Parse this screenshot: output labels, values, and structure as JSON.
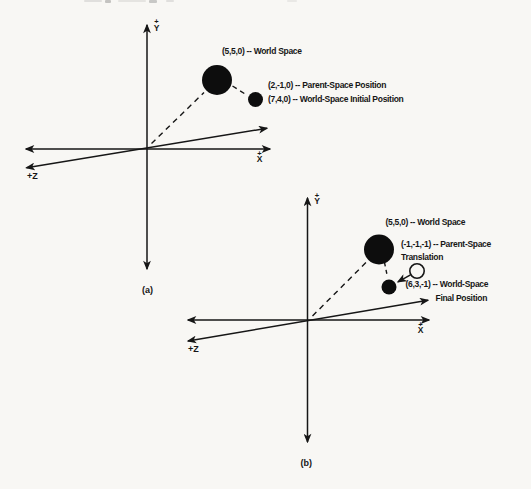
{
  "page": {
    "background": "#f8f7f4",
    "ink": "#161616"
  },
  "diagram_a": {
    "caption": "(a)",
    "axis_labels": {
      "y_plus": "+",
      "y_letter": "Y",
      "x_plus": "+",
      "x_letter": "X",
      "z": "+Z"
    },
    "annotations": {
      "world_space": "(5,5,0) -- World Space",
      "parent_space_position": "(2,-1,0) -- Parent-Space Position",
      "world_space_initial_position": "(7,4,0) -- World-Space Initial Position"
    }
  },
  "diagram_b": {
    "caption": "(b)",
    "axis_labels": {
      "y_plus": "+",
      "y_letter": "Y",
      "x_plus": "+",
      "x_letter": "X",
      "z": "+Z"
    },
    "annotations": {
      "world_space": "(5,5,0) -- World Space",
      "parent_space_translation_line1": "(-1,-1,-1) -- Parent-Space",
      "parent_space_translation_line2": "Translation",
      "world_space_final_position_line1": "(6,3,-1) -- World-Space",
      "world_space_final_position_line2": "Final Position"
    }
  }
}
